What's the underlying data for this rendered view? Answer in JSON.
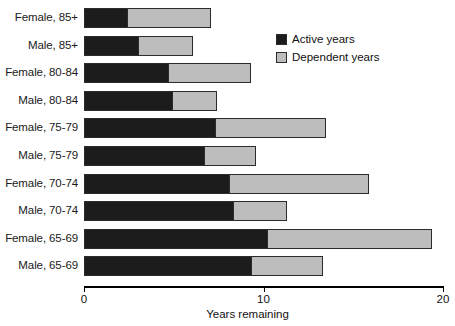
{
  "chart_data": {
    "type": "bar",
    "orientation": "horizontal",
    "stacked": true,
    "title": "",
    "xlabel": "Years remaining",
    "ylabel": "",
    "xlim": [
      0,
      20
    ],
    "xticks": [
      0,
      10,
      20
    ],
    "xtick_labels": [
      "0",
      "10",
      "20"
    ],
    "grid": false,
    "legend_position": "top-right",
    "categories": [
      "Female, 85+",
      "Male, 85+",
      "Female, 80-84",
      "Male, 80-84",
      "Female, 75-79",
      "Male, 75-79",
      "Female, 70-74",
      "Male, 70-74",
      "Female, 65-69",
      "Male, 65-69"
    ],
    "series": [
      {
        "name": "Active years",
        "color": "#1c1c1c",
        "values": [
          2.4,
          3.0,
          4.7,
          4.9,
          7.3,
          6.7,
          8.1,
          8.3,
          10.2,
          9.3
        ]
      },
      {
        "name": "Dependent years",
        "color": "#bdbdbd",
        "values": [
          4.7,
          3.1,
          4.6,
          2.5,
          6.2,
          2.9,
          7.8,
          3.0,
          9.2,
          4.0
        ]
      }
    ],
    "totals": [
      7.1,
      6.1,
      9.3,
      7.4,
      13.5,
      9.6,
      15.9,
      11.3,
      19.4,
      13.3
    ]
  },
  "legend": {
    "items": [
      {
        "label": "Active years",
        "swatch": "active"
      },
      {
        "label": "Dependent years",
        "swatch": "dependent"
      }
    ]
  },
  "axis": {
    "title": "Years remaining"
  }
}
